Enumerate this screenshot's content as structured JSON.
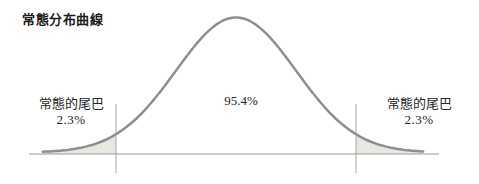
{
  "chart_data": {
    "type": "area",
    "distribution": "normal-bell-curve",
    "title": "常態分布曲線",
    "x_range_sigma": [
      -3.22,
      3.12
    ],
    "boundaries_sigma": [
      -2,
      2
    ],
    "regions": [
      {
        "name": "left-tail",
        "label": "常態的尾巴",
        "value": "2.3%",
        "range_sigma": [
          -3.22,
          -2
        ],
        "shaded": true
      },
      {
        "name": "center",
        "label": "95.4%",
        "range_sigma": [
          -2,
          2
        ],
        "shaded": false
      },
      {
        "name": "right-tail",
        "label": "常態的尾巴",
        "value": "2.3%",
        "range_sigma": [
          2,
          3.12
        ],
        "shaded": true
      }
    ],
    "grid": false,
    "legend": false,
    "colors": {
      "curve": "#8f8f8f",
      "axis": "#9c9c9c",
      "boundary": "#a6a6a6",
      "tail_fill": "#e8e7e2",
      "text": "#262626",
      "background": "#ffffff"
    }
  }
}
